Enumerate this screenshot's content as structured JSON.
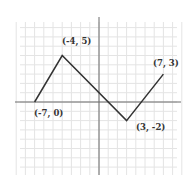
{
  "chart_data": {
    "type": "line",
    "title": "",
    "xlabel": "",
    "ylabel": "",
    "xlim": [
      -9,
      9
    ],
    "ylim": [
      -8,
      9
    ],
    "grid": true,
    "series": [
      {
        "name": "piecewise",
        "points": [
          {
            "x": -7,
            "y": 0,
            "label": "(-7, 0)"
          },
          {
            "x": -4,
            "y": 5,
            "label": "(-4, 5)"
          },
          {
            "x": 3,
            "y": -2,
            "label": "(3, -2)"
          },
          {
            "x": 7,
            "y": 3,
            "label": "(7, 3)"
          }
        ]
      }
    ]
  },
  "labels": {
    "p1": "(-7, 0)",
    "p2": "(-4, 5)",
    "p3": "(3, -2)",
    "p4": "(7, 3)"
  },
  "colors": {
    "line": "#333333",
    "axis": "#666666",
    "grid": "#e4e4e4"
  }
}
